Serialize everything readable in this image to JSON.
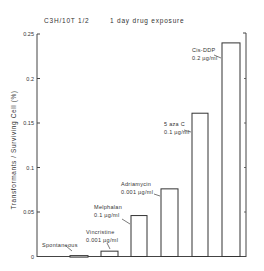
{
  "header": {
    "cell_line": "C3H/10T 1/2",
    "title": "1 day  drug  exposure"
  },
  "chart_data": {
    "type": "bar",
    "xlabel": "",
    "ylabel": "Transformants / Surviving Cell (%)",
    "ylim": [
      0,
      0.25
    ],
    "yticks": [
      "0",
      "0.05",
      "0.1",
      "0.15",
      "0.2",
      "0.25"
    ],
    "grid": false,
    "legend": "none",
    "categories": [
      "Spontaneous",
      "Vincristine 0.001 µg/ml",
      "Melphalan 0.1 µg/ml",
      "Adriamycin 0.001 µg/ml",
      "5 aza C 0.1 µg/ml",
      "Cis-DDP 0.2 µg/ml"
    ],
    "values": [
      0.001,
      0.006,
      0.046,
      0.076,
      0.161,
      0.24
    ],
    "bars": [
      {
        "name": "Spontaneous",
        "dose": "",
        "value": 0.001
      },
      {
        "name": "Vincristine",
        "dose": "0.001 µg/ml",
        "value": 0.006
      },
      {
        "name": "Melphalan",
        "dose": "0.1 µg/ml",
        "value": 0.046
      },
      {
        "name": "Adriamycin",
        "dose": "0.001 µg/ml",
        "value": 0.076
      },
      {
        "name": "5 aza C",
        "dose": "0.1 µg/ml",
        "value": 0.161
      },
      {
        "name": "Cis-DDP",
        "dose": "0.2 µg/ml",
        "value": 0.24
      }
    ]
  }
}
